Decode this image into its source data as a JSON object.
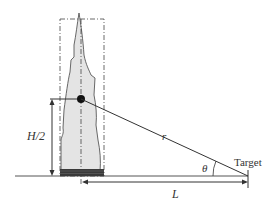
{
  "diagram": {
    "labels": {
      "half_height": "H/2",
      "distance_r": "r",
      "angle": "θ",
      "target": "Target",
      "distance_L": "L"
    },
    "colors": {
      "flame_fill": "#e4e4e4",
      "stroke": "#333333",
      "fuel_bed": "#3a3a3a"
    }
  }
}
